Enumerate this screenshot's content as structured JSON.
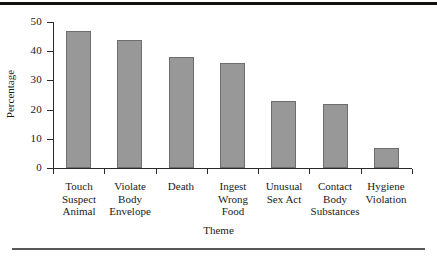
{
  "chart_data": {
    "type": "bar",
    "title": "",
    "xlabel": "Theme",
    "ylabel": "Percentage",
    "categories": [
      "Touch Suspect Animal",
      "Violate Body Envelope",
      "Death",
      "Ingest Wrong Food",
      "Unusual Sex Act",
      "Contact Body Substances",
      "Hygiene Violation"
    ],
    "category_lines": [
      [
        "Touch",
        "Suspect",
        "Animal"
      ],
      [
        "Violate",
        "Body",
        "Envelope"
      ],
      [
        "Death"
      ],
      [
        "Ingest",
        "Wrong",
        "Food"
      ],
      [
        "Unusual",
        "Sex Act"
      ],
      [
        "Contact",
        "Body",
        "Substances"
      ],
      [
        "Hygiene",
        "Violation"
      ]
    ],
    "values": [
      47,
      44,
      38,
      36,
      23,
      22,
      7
    ],
    "ylim": [
      0,
      50
    ],
    "yticks": [
      0,
      10,
      20,
      30,
      40,
      50
    ],
    "ytick_labels": [
      "0",
      "10",
      "20",
      "30",
      "40",
      "50"
    ],
    "grid": false,
    "legend": "none",
    "bar_color": "#989898",
    "bar_edge_color": "#6d6d6d",
    "axis_color": "#2b2b2b"
  },
  "figure": {
    "top_rule_color": "#12110f",
    "bottom_rule_color": "#585858",
    "background": "#ffffff"
  }
}
